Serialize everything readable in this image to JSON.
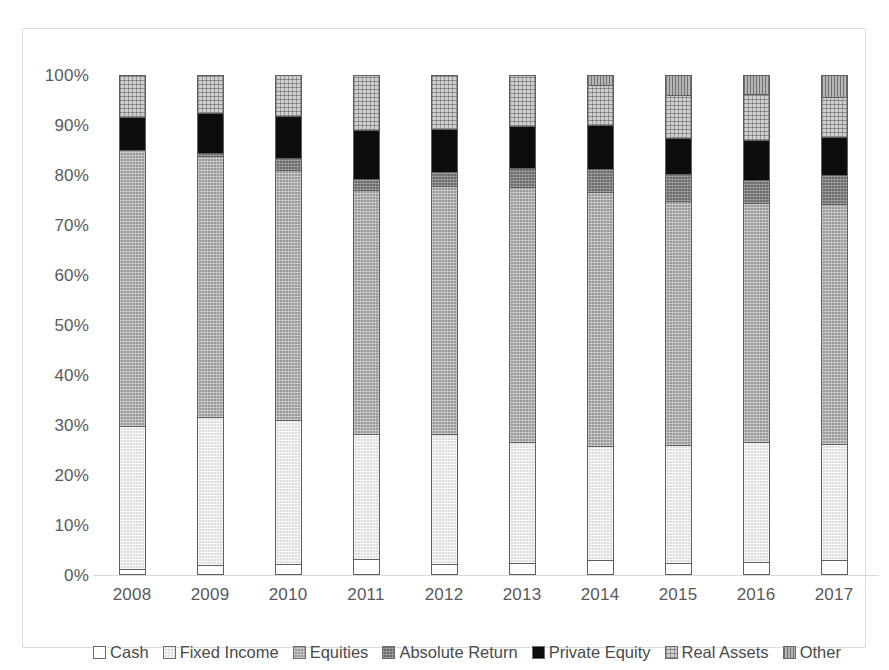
{
  "chart_data": {
    "type": "bar",
    "variant": "stacked-100",
    "title": "",
    "subtitle": "",
    "xlabel": "",
    "ylabel": "",
    "grid": false,
    "legend_position": "bottom",
    "ylim": [
      0,
      100
    ],
    "yticks": [
      "0%",
      "10%",
      "20%",
      "30%",
      "40%",
      "50%",
      "60%",
      "70%",
      "80%",
      "90%",
      "100%"
    ],
    "ytick_values": [
      0,
      10,
      20,
      30,
      40,
      50,
      60,
      70,
      80,
      90,
      100
    ],
    "categories": [
      "2008",
      "2009",
      "2010",
      "2011",
      "2012",
      "2013",
      "2014",
      "2015",
      "2016",
      "2017"
    ],
    "series": [
      {
        "name": "Cash",
        "fill": "fill-cash",
        "color": "#ffffff",
        "values": [
          1.2,
          2.0,
          2.2,
          3.3,
          2.3,
          2.4,
          3.0,
          2.4,
          2.7,
          3.0
        ]
      },
      {
        "name": "Fixed Income",
        "fill": "fill-fixed",
        "color": "#dedede",
        "values": [
          28.6,
          29.7,
          28.8,
          25.0,
          26.0,
          24.3,
          22.8,
          23.6,
          24.0,
          23.3
        ]
      },
      {
        "name": "Equities",
        "fill": "fill-equities",
        "color": "#9a9a9a",
        "values": [
          55.2,
          52.1,
          50.0,
          48.7,
          49.5,
          50.9,
          50.8,
          48.9,
          47.8,
          47.9
        ]
      },
      {
        "name": "Absolute Return",
        "fill": "fill-absolute",
        "color": "#6d6d6d",
        "values": [
          0.0,
          0.7,
          2.5,
          2.2,
          2.9,
          3.9,
          4.7,
          5.4,
          4.5,
          5.9
        ]
      },
      {
        "name": "Private Equity",
        "fill": "fill-private",
        "color": "#0d0d0d",
        "values": [
          6.6,
          7.9,
          8.4,
          9.9,
          8.6,
          8.4,
          8.7,
          7.1,
          8.1,
          7.6
        ]
      },
      {
        "name": "Real Assets",
        "fill": "fill-real",
        "color": "#cfcfcf",
        "values": [
          8.4,
          7.6,
          8.1,
          10.9,
          10.7,
          10.1,
          8.1,
          8.6,
          9.1,
          7.9
        ]
      },
      {
        "name": "Other",
        "fill": "fill-other",
        "color": "#b5b5b5",
        "values": [
          0.0,
          0.0,
          0.0,
          0.0,
          0.0,
          0.0,
          1.9,
          4.0,
          3.8,
          4.4
        ]
      }
    ]
  },
  "legend": {
    "items": [
      {
        "label": "Cash"
      },
      {
        "label": "Fixed Income"
      },
      {
        "label": "Equities"
      },
      {
        "label": "Absolute Return"
      },
      {
        "label": "Private Equity"
      },
      {
        "label": "Real Assets"
      },
      {
        "label": "Other"
      }
    ]
  },
  "colors": {
    "frame_border": "#dcdcdc",
    "axis_line": "#d9d9d9",
    "tick_text": "#5a5a5a",
    "legend_text": "#4a4a4a",
    "segment_outline": "#5f5f5f"
  }
}
